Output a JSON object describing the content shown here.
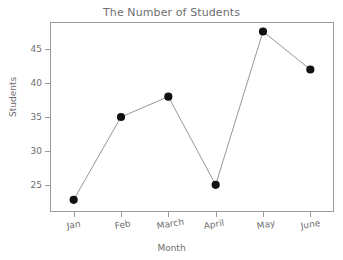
{
  "chart_data": {
    "type": "line",
    "title": "The Number of Students",
    "xlabel": "Month",
    "ylabel": "Students",
    "categories": [
      "Jan",
      "Feb",
      "March",
      "April",
      "May",
      "June"
    ],
    "values": [
      22.8,
      35,
      38,
      25,
      47.6,
      42
    ],
    "ytick_labels": [
      "25",
      "30",
      "35",
      "40",
      "45"
    ],
    "ytick_values": [
      25,
      30,
      35,
      40,
      45
    ],
    "ylim": [
      21.0,
      49.0
    ],
    "xlim": [
      0.5,
      6.5
    ],
    "grid": false,
    "legend": false,
    "marker": "filled-circle",
    "marker_color": "#111111",
    "line_color": "#8a8a8a",
    "frame_color": "#9a9a9a",
    "text_color": "#6e6e6e",
    "background_color": "#ffffff",
    "series": [
      {
        "name": "Students",
        "values": [
          22.8,
          35,
          38,
          25,
          47.6,
          42
        ]
      }
    ],
    "points": [
      {
        "category": "Jan",
        "value": 22.8
      },
      {
        "category": "Feb",
        "value": 35
      },
      {
        "category": "March",
        "value": 38
      },
      {
        "category": "April",
        "value": 25
      },
      {
        "category": "May",
        "value": 47.6
      },
      {
        "category": "June",
        "value": 42
      }
    ]
  }
}
